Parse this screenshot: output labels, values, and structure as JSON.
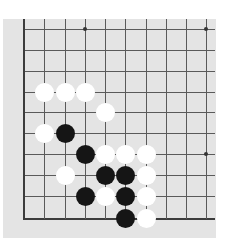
{
  "board": {
    "colors": {
      "background": "#e4e4e4",
      "line": "#5a5a5a",
      "black": "#151515",
      "white": "#ffffff"
    },
    "columns_x": [
      23,
      44,
      65,
      85,
      105,
      125,
      146,
      166,
      186,
      206
    ],
    "rows_y": [
      29,
      50,
      71,
      92,
      112,
      133,
      154,
      175,
      196,
      218
    ],
    "star_points": [
      {
        "col": 3,
        "row": 0
      },
      {
        "col": 9,
        "row": 0
      },
      {
        "col": 9,
        "row": 6
      }
    ],
    "stones": [
      {
        "color": "white",
        "col": 1,
        "row": 3
      },
      {
        "color": "white",
        "col": 2,
        "row": 3
      },
      {
        "color": "white",
        "col": 3,
        "row": 3
      },
      {
        "color": "white",
        "col": 4,
        "row": 4
      },
      {
        "color": "white",
        "col": 1,
        "row": 5
      },
      {
        "color": "black",
        "col": 2,
        "row": 5
      },
      {
        "color": "black",
        "col": 3,
        "row": 6
      },
      {
        "color": "white",
        "col": 4,
        "row": 6
      },
      {
        "color": "white",
        "col": 5,
        "row": 6
      },
      {
        "color": "white",
        "col": 6,
        "row": 6
      },
      {
        "color": "white",
        "col": 2,
        "row": 7
      },
      {
        "color": "black",
        "col": 4,
        "row": 7
      },
      {
        "color": "black",
        "col": 5,
        "row": 7
      },
      {
        "color": "white",
        "col": 6,
        "row": 7
      },
      {
        "color": "black",
        "col": 3,
        "row": 8
      },
      {
        "color": "white",
        "col": 4,
        "row": 8
      },
      {
        "color": "black",
        "col": 5,
        "row": 8
      },
      {
        "color": "white",
        "col": 6,
        "row": 8
      },
      {
        "color": "black",
        "col": 5,
        "row": 9
      },
      {
        "color": "white",
        "col": 6,
        "row": 9
      }
    ]
  }
}
